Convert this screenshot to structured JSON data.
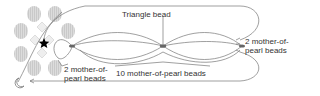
{
  "diagram": {
    "labels": {
      "triangle_bead": "Triangle bead",
      "right_beads_line1": "2 mother-of-",
      "right_beads_line2": "pearl beads",
      "left_beads_line1": "2 mother-of-",
      "left_beads_line2": "pearl beads",
      "bottom_beads": "10 mother-of-pearl beads"
    },
    "icons": {
      "start_marker": "star-icon",
      "end_marker": "crescent-moon-icon"
    },
    "colors": {
      "line": "#777777",
      "petal": "#d9d9d9",
      "petal_stripe": "#c4c4c4",
      "triangle_bead": "#666666",
      "star": "#000000",
      "text": "#333333"
    }
  }
}
